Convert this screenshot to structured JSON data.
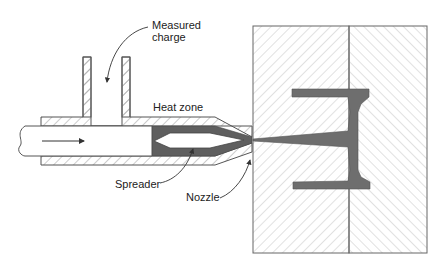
{
  "diagram": {
    "type": "injection-molding-cross-section",
    "labels": {
      "measured_charge_line1": "Measured",
      "measured_charge_line2": "charge",
      "heat_zone": "Heat zone",
      "spreader": "Spreader",
      "nozzle": "Nozzle"
    },
    "colors": {
      "line": "#555555",
      "hatch": "#9a9a9a",
      "molten": "#6e6e6e",
      "background": "#ffffff"
    }
  }
}
